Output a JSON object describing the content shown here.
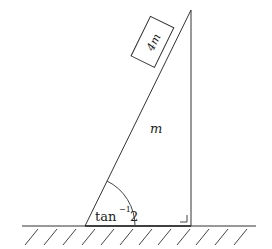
{
  "diagram": {
    "block_label": "4m",
    "wedge_label": "m",
    "angle_label_base": "tan",
    "angle_label_sup": "−1",
    "angle_label_arg": "2",
    "line_color": "#333333"
  }
}
